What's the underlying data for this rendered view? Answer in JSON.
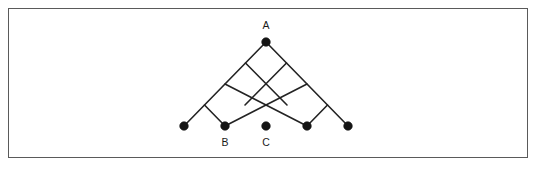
{
  "figure": {
    "kind": "diamond-lattice-diagram",
    "canvas": {
      "width": 536,
      "height": 169
    },
    "background_color": "#ffffff",
    "frame": {
      "x": 8,
      "y": 8,
      "width": 519,
      "height": 149,
      "stroke_color": "#5a5a5a",
      "stroke_width": 1,
      "fill_color": "#ffffff"
    },
    "style": {
      "edge_color": "#232323",
      "edge_width": 1.6,
      "node_color": "#151515",
      "node_radius": 4.3,
      "label_color": "#1a1a1a",
      "label_font_size": 10.5
    },
    "geometry": {
      "apex_x": 266,
      "apex_y": 42,
      "baseline_y": 126,
      "cell_half_width": 20.5,
      "cell_half_height": 21,
      "levels": 4,
      "bottom_node_count": 5,
      "bottom_node_spacing": 41
    },
    "nodes": [
      {
        "id": "A",
        "label": "A",
        "x": 266,
        "y": 42,
        "label_x": 266,
        "label_y": 29,
        "has_label": true
      },
      {
        "id": "n1",
        "label": "",
        "x": 184,
        "y": 126,
        "label_x": 184,
        "label_y": 146,
        "has_label": false
      },
      {
        "id": "B",
        "label": "B",
        "x": 225,
        "y": 126,
        "label_x": 225,
        "label_y": 146,
        "has_label": true
      },
      {
        "id": "C",
        "label": "C",
        "x": 266,
        "y": 126,
        "label_x": 266,
        "label_y": 146,
        "has_label": true
      },
      {
        "id": "n4",
        "label": "",
        "x": 307,
        "y": 126,
        "label_x": 307,
        "label_y": 146,
        "has_label": false
      },
      {
        "id": "n5",
        "label": "",
        "x": 348,
        "y": 126,
        "label_x": 348,
        "label_y": 146,
        "has_label": false
      }
    ],
    "edges": [
      {
        "x1": 266,
        "y1": 42,
        "x2": 184,
        "y2": 126
      },
      {
        "x1": 266,
        "y1": 42,
        "x2": 348,
        "y2": 126
      },
      {
        "x1": 245.5,
        "y1": 63,
        "x2": 287,
        "y2": 105
      },
      {
        "x1": 225,
        "y1": 84,
        "x2": 307,
        "y2": 126
      },
      {
        "x1": 204.5,
        "y1": 105,
        "x2": 225,
        "y2": 126
      },
      {
        "x1": 286.5,
        "y1": 63,
        "x2": 245,
        "y2": 105
      },
      {
        "x1": 307,
        "y1": 84,
        "x2": 225,
        "y2": 126
      },
      {
        "x1": 327.5,
        "y1": 105,
        "x2": 307,
        "y2": 126
      }
    ],
    "labels": [
      {
        "text": "A",
        "x": 266,
        "y": 29
      },
      {
        "text": "B",
        "x": 225,
        "y": 146
      },
      {
        "text": "C",
        "x": 266,
        "y": 146
      }
    ]
  }
}
